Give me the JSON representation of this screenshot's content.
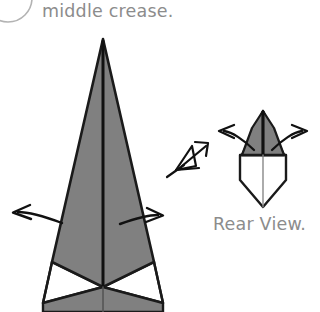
{
  "document": {
    "type": "origami-instruction-diagram",
    "background_color": "#ffffff"
  },
  "palette": {
    "paper_front": "#808080",
    "paper_back": "#ffffff",
    "outline": "#1a1a1a",
    "crease": "#111111",
    "caption_text": "#8c8c8c",
    "step_badge_stroke": "#b3b3b3"
  },
  "step_badge": {
    "name": "step-number-badge",
    "visible_partially": true,
    "label": ""
  },
  "instruction": {
    "text": "middle crease."
  },
  "main_figure": {
    "name": "main-model-figure",
    "description": "tall narrow kite-like model seen from front with vertical middle crease",
    "apex": {
      "x": 103,
      "y": 39
    },
    "fill": "#808080",
    "outline": "#1a1a1a",
    "crease_label": "middle crease",
    "white_flaps": 2
  },
  "main_arrows": [
    {
      "name": "arrow-left-open",
      "direction": "left",
      "tip": {
        "x": 12,
        "y": 213
      },
      "tail": {
        "x": 62,
        "y": 222
      }
    },
    {
      "name": "arrow-right-open",
      "direction": "right",
      "tip": {
        "x": 162,
        "y": 216
      },
      "tail": {
        "x": 120,
        "y": 222
      }
    }
  ],
  "view_symbol": {
    "name": "view-direction-eye-symbol",
    "description": "origami 'look from here' arrow with eye wedge",
    "position": {
      "x": 170,
      "y": 140
    },
    "points_to": "rear-view-figure"
  },
  "rear_view": {
    "name": "rear-view-figure",
    "caption": "Rear View.",
    "apex": {
      "x": 263,
      "y": 111
    },
    "gray_region_fill": "#808080",
    "white_region_fill": "#ffffff",
    "bottom_tip": {
      "x": 263,
      "y": 207
    },
    "arrows": [
      {
        "name": "rear-arrow-left",
        "direction": "left",
        "tip": {
          "x": 218,
          "y": 132
        },
        "tail": {
          "x": 252,
          "y": 145
        }
      },
      {
        "name": "rear-arrow-right",
        "direction": "right",
        "tip": {
          "x": 308,
          "y": 131
        },
        "tail": {
          "x": 274,
          "y": 145
        }
      }
    ]
  }
}
